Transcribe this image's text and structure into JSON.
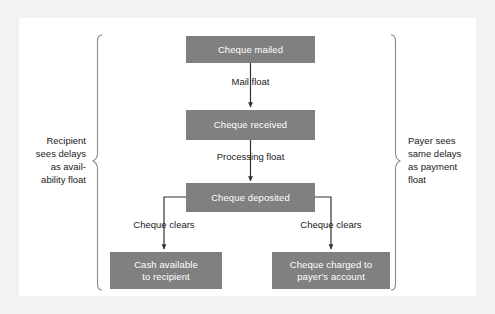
{
  "figure": {
    "background_color": "#f2f2f2",
    "canvas_color": "#ffffff",
    "node_color": "#808080",
    "node_text_color": "#ffffff",
    "line_color": "#333333",
    "label_text_color": "#1a1a1a"
  },
  "nodes": {
    "cheque_mailed": "Cheque mailed",
    "cheque_received": "Cheque received",
    "cheque_deposited": "Cheque deposited",
    "cash_available_line1": "Cash available",
    "cash_available_line2": "to recipient",
    "cheque_charged_line1": "Cheque charged to",
    "cheque_charged_line2": "payer's account"
  },
  "edge_labels": {
    "mail_float": "Mail float",
    "processing_float": "Processing float",
    "cheque_clears_left": "Cheque clears",
    "cheque_clears_right": "Cheque clears"
  },
  "side_labels": {
    "recipient": "Recipient\nsees delays\nas avail-\nability float",
    "payer": "Payer sees\nsame delays\nas payment\nfloat"
  }
}
